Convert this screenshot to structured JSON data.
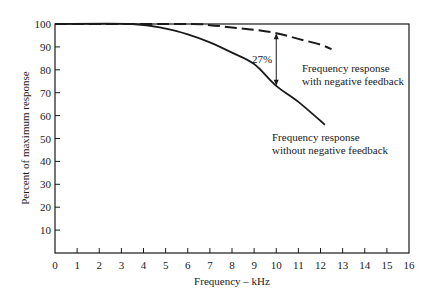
{
  "chart_data": {
    "type": "line",
    "title": "",
    "xlabel": "Frequency – kHz",
    "ylabel": "Percent of maximum response",
    "xlim": [
      0,
      16
    ],
    "ylim": [
      0,
      100
    ],
    "xticks": [
      0,
      1,
      2,
      3,
      4,
      5,
      6,
      7,
      8,
      9,
      10,
      11,
      12,
      13,
      14,
      15,
      16
    ],
    "yticks": [
      10,
      20,
      30,
      40,
      50,
      60,
      70,
      80,
      90,
      100
    ],
    "grid": false,
    "series": [
      {
        "name": "Frequency response without negative feedback",
        "style": "solid",
        "x": [
          0,
          3.5,
          5,
          6,
          7,
          8,
          9,
          10,
          11,
          12.2
        ],
        "y": [
          100,
          100,
          98,
          95.5,
          92,
          87.5,
          82.5,
          73,
          66,
          56
        ]
      },
      {
        "name": "Frequency response with negative feedback",
        "style": "dashed",
        "x": [
          0,
          6,
          7,
          8,
          9,
          10,
          11,
          12,
          12.5
        ],
        "y": [
          100,
          100,
          99.5,
          98.5,
          97.5,
          96,
          93.5,
          91,
          89
        ]
      }
    ],
    "annotations": [
      {
        "text": "27%",
        "x": 10,
        "y_from": 73,
        "y_to": 96,
        "type": "double-arrow"
      },
      {
        "text_lines": [
          "Frequency response",
          "with negative feedback"
        ],
        "x": 10.8,
        "y": 92
      },
      {
        "text_lines": [
          "Frequency response",
          "without negative feedback"
        ],
        "x": 10.8,
        "y": 50
      }
    ]
  },
  "labels": {
    "xlabel": "Frequency – kHz",
    "ylabel": "Percent of maximum response",
    "gap": "27%",
    "with_fb_line1": "Frequency response",
    "with_fb_line2": "with negative feedback",
    "without_fb_line1": "Frequency response",
    "without_fb_line2": "without negative feedback"
  }
}
